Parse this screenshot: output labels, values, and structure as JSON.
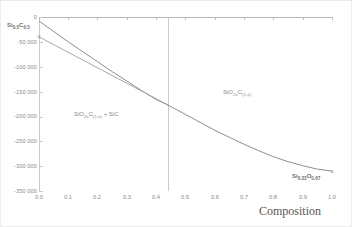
{
  "chart_data": {
    "type": "line",
    "title": "",
    "xlabel": "Composition",
    "ylabel": "",
    "xlim": [
      0.0,
      1.0
    ],
    "ylim": [
      -350000,
      0
    ],
    "grid": false,
    "legend": "none",
    "xticks": [
      "0.0",
      "0.1",
      "0.2",
      "0.3",
      "0.4",
      "0.5",
      "0.6",
      "0.7",
      "0.8",
      "0.9",
      "1.0"
    ],
    "yticks": [
      "0",
      "-50 000",
      "-100 000",
      "-150 000",
      "-200 000",
      "-250 000",
      "-300 000",
      "-350 000"
    ],
    "ytick_values": [
      0,
      -50000,
      -100000,
      -150000,
      -200000,
      -250000,
      -300000,
      -350000
    ],
    "xtick_values": [
      0.0,
      0.1,
      0.2,
      0.3,
      0.4,
      0.5,
      0.6,
      0.7,
      0.8,
      0.9,
      1.0
    ],
    "series": [
      {
        "name": "Gibbs energy curve",
        "color": "#808080",
        "x": [
          0.0,
          0.05,
          0.1,
          0.15,
          0.2,
          0.25,
          0.3,
          0.35,
          0.4,
          0.44,
          0.5,
          0.55,
          0.6,
          0.65,
          0.7,
          0.75,
          0.8,
          0.85,
          0.9,
          0.95,
          1.0
        ],
        "y": [
          -8000,
          -29000,
          -50000,
          -70000,
          -90000,
          -110000,
          -129000,
          -148000,
          -166000,
          -177000,
          -196000,
          -212000,
          -228000,
          -242000,
          -256000,
          -269000,
          -281000,
          -291000,
          -299000,
          -306000,
          -310000
        ]
      },
      {
        "name": "Tie line (two-phase common tangent)",
        "color": "#9e9e9e",
        "x": [
          0.0,
          0.44
        ],
        "y": [
          -40000,
          -177000
        ]
      }
    ],
    "markers": [
      {
        "label": "Si(0.5)C(0.5) end member",
        "x": 0.0,
        "y": -40000,
        "symbol": "x"
      },
      {
        "label": "Si(0.33)O(0.67) end member",
        "x": 1.0,
        "y": -310000,
        "symbol": "x"
      }
    ],
    "vertical_lines": [
      {
        "label": "phase boundary",
        "x": 0.44,
        "color": "#cccccc"
      }
    ],
    "annotations": {
      "endpoint_left": {
        "text": "Si0.5C0.5",
        "base1": "Si",
        "sub1": "0.5",
        "base2": "C",
        "sub2": "0.5",
        "x": 0.0,
        "y": -40000
      },
      "endpoint_right": {
        "text": "Si0.33O0.67",
        "base1": "Si",
        "sub1": "0.33",
        "base2": "O",
        "sub2": "0.67",
        "x": 1.0,
        "y": -310000
      },
      "region_two_phase": {
        "text": "SiO2xC(1-x) + SiC",
        "b1": "SiO",
        "s1": "2x",
        "b2": "C",
        "s2": "(1-x)",
        "tail": " + SiC",
        "x": 0.22,
        "y": -196000
      },
      "region_single_phase": {
        "text": "SiO2xC(1-x)",
        "b1": "SiO",
        "s1": "2x",
        "b2": "C",
        "s2": "(1-x)",
        "x": 0.68,
        "y": -152000
      }
    },
    "colors": {
      "axis": "#c9c9c9",
      "curve": "#808080",
      "tie_line": "#9e9e9e",
      "boundary": "#cccccc",
      "text": "#8a8a8a",
      "background": "#ffffff"
    }
  }
}
